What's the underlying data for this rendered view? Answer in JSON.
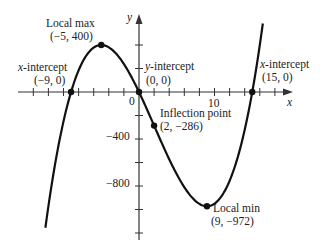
{
  "chart_data": {
    "type": "line",
    "title": "",
    "function": "f(x) = x^3 - 6x^2 - 135x",
    "xlabel": "x",
    "ylabel": "y",
    "xlim": [
      -12.4,
      16.4
    ],
    "ylim": [
      -1183,
      613
    ],
    "x_ticks_step": 2,
    "y_ticks_step": 200,
    "x_tick_labels": [
      {
        "value": 0,
        "label": "0"
      },
      {
        "value": 10,
        "label": "10"
      }
    ],
    "y_tick_labels": [
      {
        "value": -400,
        "label": "−400"
      },
      {
        "value": -800,
        "label": "−800"
      }
    ],
    "grid": false,
    "series": [
      {
        "name": "f(x)",
        "x": [
          -12.4,
          -12,
          -11,
          -10,
          -9,
          -8,
          -7,
          -6,
          -5,
          -4,
          -3,
          -2,
          -1,
          0,
          1,
          2,
          3,
          4,
          5,
          6,
          7,
          8,
          9,
          10,
          11,
          12,
          13,
          14,
          15,
          16,
          16.4
        ],
        "values": [
          -1158,
          -972,
          -616,
          -350,
          0,
          184,
          308,
          378,
          400,
          380,
          324,
          238,
          128,
          0,
          -140,
          -286,
          -432,
          -572,
          -700,
          -810,
          -896,
          -952,
          -972,
          -950,
          -880,
          -756,
          -572,
          -322,
          0,
          400,
          567
        ]
      }
    ],
    "annotations": [
      {
        "name": "local-max",
        "title": "Local max",
        "coords": "(−5, 400)",
        "x": -5,
        "y": 400
      },
      {
        "name": "x-intercept-left",
        "title": "x-intercept",
        "coords": "(−9, 0)",
        "x": -9,
        "y": 0
      },
      {
        "name": "y-intercept",
        "title": "y-intercept",
        "coords": "(0, 0)",
        "x": 0,
        "y": 0
      },
      {
        "name": "inflection-point",
        "title": "Inflection point",
        "coords": "(2, −286)",
        "x": 2,
        "y": -286
      },
      {
        "name": "local-min",
        "title": "Local min",
        "coords": "(9, −972)",
        "x": 9,
        "y": -972
      },
      {
        "name": "x-intercept-right",
        "title": "x-intercept",
        "coords": "(15, 0)",
        "x": 15,
        "y": 0
      }
    ]
  },
  "labels": {
    "local_max_title": "Local max",
    "local_max_coords": "(−5, 400)",
    "xint_left_title_var": "x",
    "xint_left_title_rest": "-intercept",
    "xint_left_coords": "(−9, 0)",
    "yint_title_var": "y",
    "yint_title_rest": "-intercept",
    "yint_coords": "(0, 0)",
    "inflection_title": "Inflection point",
    "inflection_coords": "(2, −286)",
    "local_min_title": "Local min",
    "local_min_coords": "(9, −972)",
    "xint_right_title_var": "x",
    "xint_right_title_rest": "-intercept",
    "xint_right_coords": "(15, 0)",
    "x_axis_label": "x",
    "y_axis_label": "y",
    "tick_0": "0",
    "tick_10": "10",
    "tick_m400": "−400",
    "tick_m800": "−800"
  },
  "colors": {
    "curve": "#111111",
    "axis": "#333333",
    "text": "#222222",
    "background": "#ffffff"
  }
}
